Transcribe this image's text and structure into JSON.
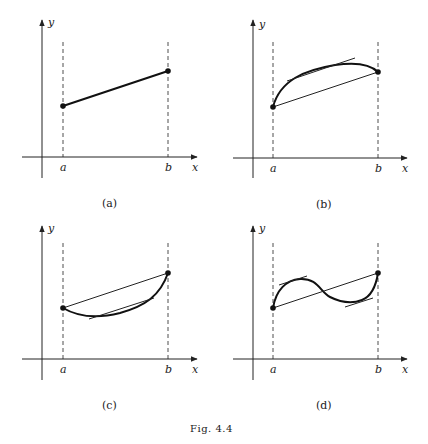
{
  "figure": {
    "caption": "Fig. 4.4",
    "panels": [
      {
        "id": "a",
        "caption": "(a)",
        "axis_x": "x",
        "axis_y": "y",
        "tick_a": "a",
        "tick_b": "b",
        "description": "straight line segment between endpoints"
      },
      {
        "id": "b",
        "caption": "(b)",
        "axis_x": "x",
        "axis_y": "y",
        "tick_a": "a",
        "tick_b": "b",
        "description": "concave curve with chord and parallel tangent"
      },
      {
        "id": "c",
        "caption": "(c)",
        "axis_x": "x",
        "axis_y": "y",
        "tick_a": "a",
        "tick_b": "b",
        "description": "convex curve with chord and parallel tangent"
      },
      {
        "id": "d",
        "caption": "(d)",
        "axis_x": "x",
        "axis_y": "y",
        "tick_a": "a",
        "tick_b": "b",
        "description": "S-shaped curve with chord and two parallel tangents"
      }
    ]
  }
}
